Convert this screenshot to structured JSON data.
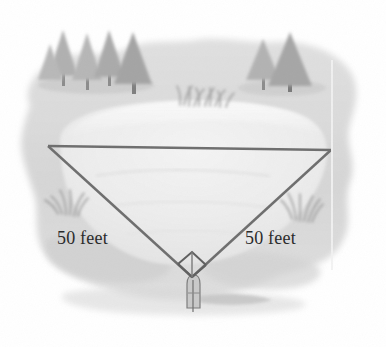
{
  "figure": {
    "type": "geometry-diagram"
  },
  "labels": {
    "left_leg": "50 feet",
    "right_leg": "50 feet"
  },
  "measurements": {
    "leg_length_value": "50",
    "leg_unit": "feet",
    "vertex_angle": "90"
  },
  "colors": {
    "page_background": "#ffffff",
    "land": "#dcdcdc",
    "land_shadow": "#cfcfcf",
    "lake_fill": "#e9e9e9",
    "lake_highlight": "#f5f5f5",
    "tree": "#b4b4b4",
    "tree_dark": "#a0a0a0",
    "trunk": "#8c8c8c",
    "grass": "#9a9a9a",
    "triangle_line": "#6e6e6e",
    "post": "#b8b8b8",
    "post_outline": "#7a7a7a",
    "label_text": "#2b2b2b",
    "scanline": "#f0f0f0"
  },
  "geometry": {
    "left_vertex": {
      "x": 48,
      "y": 146
    },
    "right_vertex": {
      "x": 331,
      "y": 150
    },
    "apex_vertex": {
      "x": 192,
      "y": 277
    }
  },
  "elements": {
    "tree_cluster_left": "pine-tree-cluster",
    "tree_cluster_right": "pine-tree-cluster",
    "grass_top": "grass-tuft",
    "grass_left": "grass-tuft",
    "grass_right": "grass-tuft",
    "survey_post": "survey-stake",
    "right_angle_marker": "right-angle-square"
  }
}
